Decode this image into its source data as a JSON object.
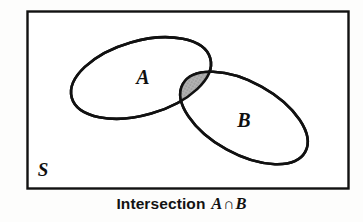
{
  "figure": {
    "kind": "venn-diagram",
    "universe_label": "S",
    "set_a_label": "A",
    "set_b_label": "B",
    "shaded_region": "intersection",
    "caption": {
      "word": "Intersection",
      "left_set": "A",
      "operator": "∩",
      "right_set": "B",
      "full_text": "Intersection A ∩ B"
    },
    "colors": {
      "stroke": "#111111",
      "background": "#fdfdfc",
      "shade_fill": "#a9a9a9",
      "set_fill": "#ffffff"
    },
    "geometry": {
      "universe_rect": {
        "x": 27,
        "y": 11,
        "width": 322,
        "height": 178
      },
      "ellipse_a": {
        "cx": 141,
        "cy": 78,
        "rx": 72,
        "ry": 37,
        "rotation_deg": -16
      },
      "ellipse_b": {
        "cx": 244,
        "cy": 118,
        "rx": 70,
        "ry": 36,
        "rotation_deg": 29
      },
      "label_a": {
        "x": 143,
        "y": 77
      },
      "label_b": {
        "x": 244,
        "y": 120
      },
      "label_s": {
        "x": 43,
        "y": 175
      }
    }
  }
}
